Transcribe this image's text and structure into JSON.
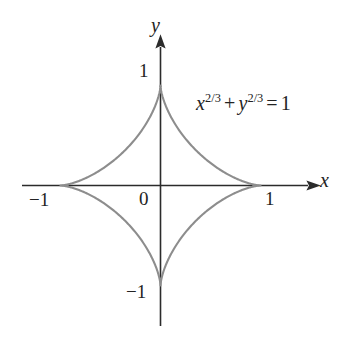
{
  "figure": {
    "kind": "math-curve-plot",
    "background_color": "#ffffff",
    "curve_color": "#8d8d8d",
    "axis_color": "#2b2b2b",
    "text_color": "#232323"
  },
  "axes": {
    "x_label": "x",
    "y_label": "y",
    "origin_label": "0",
    "x_ticks": [
      {
        "value": -1,
        "label": "−1"
      },
      {
        "value": 1,
        "label": "1"
      }
    ],
    "y_ticks": [
      {
        "value": 1,
        "label": "1"
      },
      {
        "value": -1,
        "label": "−1"
      }
    ],
    "arrowheads": {
      "x_positive": true,
      "y_positive": true
    },
    "grid": false
  },
  "equation": {
    "full_text": "x^{2/3} + y^{2/3} = 1",
    "base_x": "x",
    "exponent_x": "2/3",
    "operator": "+",
    "base_y": "y",
    "exponent_y": "2/3",
    "equals": "=",
    "rhs": "1"
  },
  "chart_data": {
    "type": "line",
    "title": "",
    "subtitle": "",
    "xlabel": "x",
    "ylabel": "y",
    "xlim": [
      -1.35,
      1.35
    ],
    "ylim": [
      -1.45,
      1.45
    ],
    "grid": false,
    "legend": null,
    "annotations": [
      {
        "text": "x^{2/3} + y^{2/3} = 1",
        "x": 0.45,
        "y": 0.85
      }
    ],
    "xtick_values": [
      -1,
      0,
      1
    ],
    "xtick_labels": [
      "−1",
      "0",
      "1"
    ],
    "ytick_values": [
      -1,
      1
    ],
    "ytick_labels": [
      "−1",
      "1"
    ],
    "series": [
      {
        "name": "astroid: x^(2/3) + y^(2/3) = 1",
        "color": "#8d8d8d",
        "parametric": {
          "x": "cos(t)^3",
          "y": "sin(t)^3",
          "t_range": [
            0,
            6.283185307
          ]
        },
        "cusps": [
          {
            "x": 1,
            "y": 0
          },
          {
            "x": 0,
            "y": 1
          },
          {
            "x": -1,
            "y": 0
          },
          {
            "x": 0,
            "y": -1
          }
        ],
        "points": [
          {
            "x": 1.0,
            "y": 0.0
          },
          {
            "x": 0.9729,
            "y": 0.0018
          },
          {
            "x": 0.8941,
            "y": 0.0149
          },
          {
            "x": 0.7716,
            "y": 0.0487
          },
          {
            "x": 0.6188,
            "y": 0.1104
          },
          {
            "x": 0.4507,
            "y": 0.2024
          },
          {
            "x": 0.2829,
            "y": 0.3203
          },
          {
            "x": 0.1294,
            "y": 0.4531
          },
          {
            "x": 0.0331,
            "y": 0.5825
          },
          {
            "x": 0.0046,
            "y": 0.7061
          },
          {
            "x": 0.0003,
            "y": 0.8449
          },
          {
            "x": 0.0,
            "y": 1.0
          },
          {
            "x": -0.0003,
            "y": 0.8449
          },
          {
            "x": -0.0331,
            "y": 0.5825
          },
          {
            "x": -0.1294,
            "y": 0.4531
          },
          {
            "x": -0.2829,
            "y": 0.3203
          },
          {
            "x": -0.4507,
            "y": 0.2024
          },
          {
            "x": -0.6188,
            "y": 0.1104
          },
          {
            "x": -0.7716,
            "y": 0.0487
          },
          {
            "x": -0.8941,
            "y": 0.0149
          },
          {
            "x": -1.0,
            "y": 0.0
          },
          {
            "x": -0.8941,
            "y": -0.0149
          },
          {
            "x": -0.6188,
            "y": -0.1104
          },
          {
            "x": -0.2829,
            "y": -0.3203
          },
          {
            "x": -0.0331,
            "y": -0.5825
          },
          {
            "x": 0.0,
            "y": -1.0
          },
          {
            "x": 0.0331,
            "y": -0.5825
          },
          {
            "x": 0.2829,
            "y": -0.3203
          },
          {
            "x": 0.6188,
            "y": -0.1104
          },
          {
            "x": 0.8941,
            "y": -0.0149
          },
          {
            "x": 1.0,
            "y": 0.0
          }
        ]
      }
    ]
  }
}
